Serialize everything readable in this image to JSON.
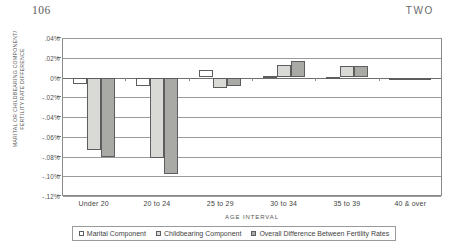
{
  "page": {
    "folio": "106",
    "chapter_label": "TWO"
  },
  "chart_data": {
    "type": "bar",
    "title": "",
    "xlabel": "AGE INTERVAL",
    "ylabel": "MARITAL OR CHILDBEARING COMPONENT/ FERTILITY RATE DIFFERENCE",
    "ylabel_line1": "MARITAL OR CHILDBEARING COMPONENT/",
    "ylabel_line2": "FERTILITY RATE DIFFERENCE",
    "categories": [
      "Under 20",
      "20 to 24",
      "25 to 29",
      "30 to 34",
      "35 to 39",
      "40 & over"
    ],
    "ylim": [
      -0.12,
      0.04
    ],
    "ytick_labels": [
      ".04%",
      ".02%",
      "0%",
      "-.02%",
      "-.04%",
      "-.06%",
      "-.08%",
      "-.10%",
      "-.12%"
    ],
    "ytick_values": [
      0.04,
      0.02,
      0,
      -0.02,
      -0.04,
      -0.06,
      -0.08,
      -0.1,
      -0.12
    ],
    "grid": true,
    "legend_position": "bottom",
    "units": "percent",
    "series": [
      {
        "name": "Marital Component",
        "color": "#ffffff",
        "values": [
          -0.007,
          -0.009,
          0.008,
          0.002,
          0.001,
          0.0
        ]
      },
      {
        "name": "Childbearing Component",
        "color": "#d9d9d6",
        "values": [
          -0.073,
          -0.082,
          -0.011,
          0.013,
          0.012,
          0.0
        ]
      },
      {
        "name": "Overall Difference Between Fertility Rates",
        "color": "#a9a9a6",
        "values": [
          -0.08,
          -0.098,
          -0.009,
          0.017,
          0.012,
          -0.001
        ]
      }
    ]
  },
  "legend": {
    "items": [
      {
        "label": "Marital Component",
        "swatch": "marital"
      },
      {
        "label": "Childbearing Component",
        "swatch": "child"
      },
      {
        "label": "Overall Difference Between Fertility Rates",
        "swatch": "overall"
      }
    ]
  }
}
